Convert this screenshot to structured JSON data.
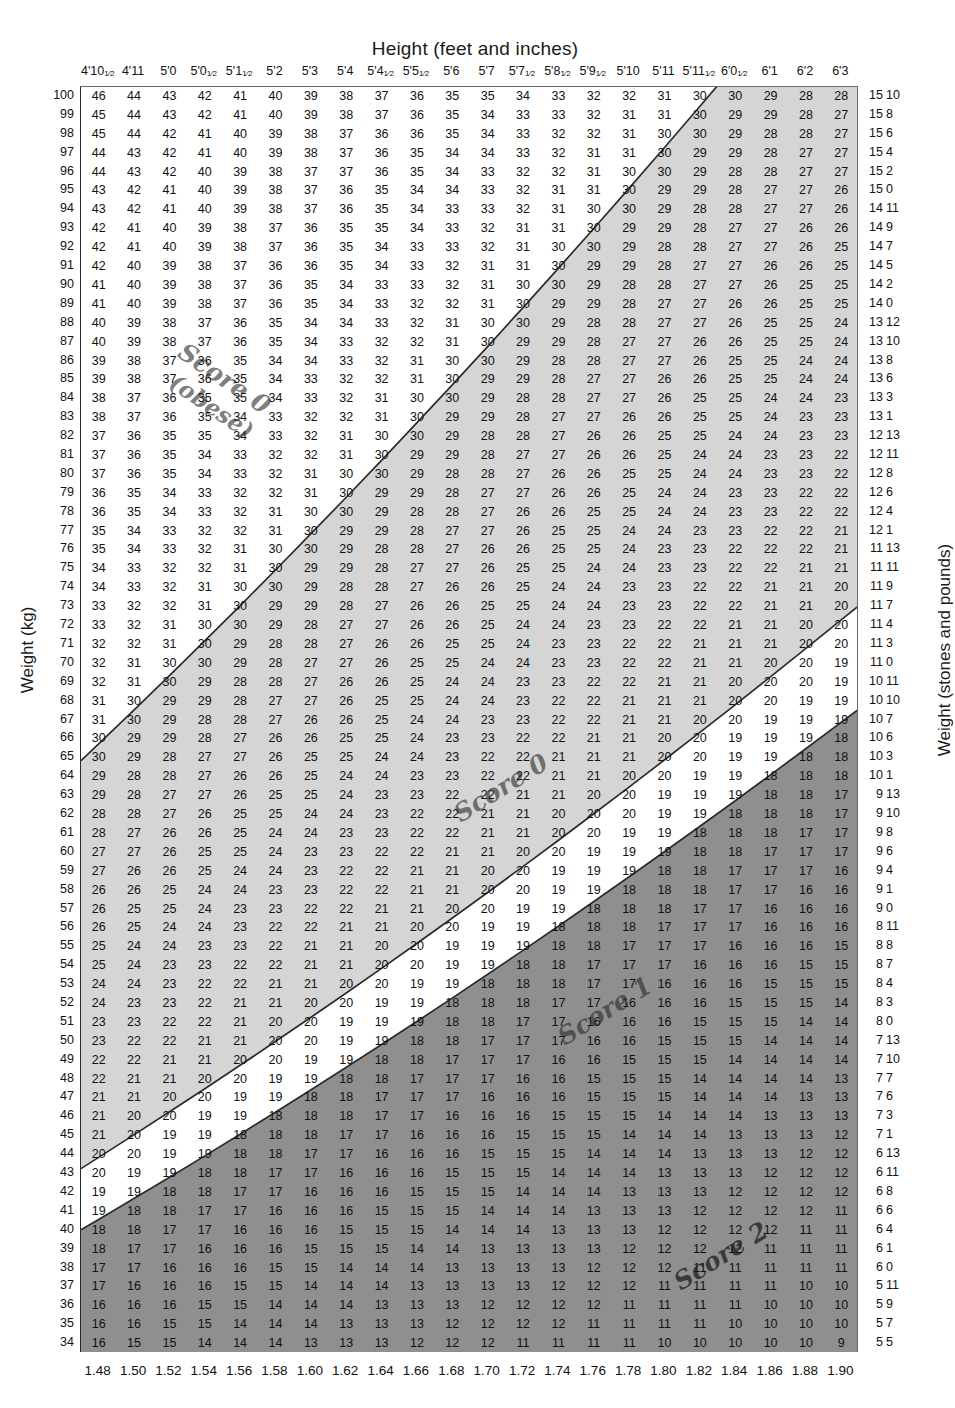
{
  "titles": {
    "top": "Height (feet and inches)",
    "left": "Weight (kg)",
    "right": "Weight (stones and pounds)"
  },
  "annotations": [
    {
      "id": "score0-obese",
      "line1": "Score 0",
      "line2": "(obese)"
    },
    {
      "id": "score0-mid",
      "line1": "Score 0",
      "line2": ""
    },
    {
      "id": "score1-note",
      "line1": "Score 1",
      "line2": ""
    },
    {
      "id": "score2-note",
      "line1": "Score 2",
      "line2": ""
    }
  ],
  "chart_data": {
    "type": "heatmap",
    "xlabel": "Height (feet and inches)",
    "ylabel": "Weight (kg)",
    "x2label": "Height (metres)",
    "y2label": "Weight (stones and pounds)",
    "grid": false,
    "legend_position": "inline-annotations",
    "value_description": "Body Mass Index = weight(kg) / height(m)^2, rounded to nearest whole number",
    "heights_m": [
      1.48,
      1.5,
      1.52,
      1.54,
      1.56,
      1.58,
      1.6,
      1.62,
      1.64,
      1.66,
      1.68,
      1.7,
      1.72,
      1.74,
      1.76,
      1.78,
      1.8,
      1.82,
      1.84,
      1.86,
      1.88,
      1.9
    ],
    "heights_imperial": [
      {
        "ft": "4'10",
        "frac": "1/2"
      },
      {
        "ft": "4'11",
        "frac": ""
      },
      {
        "ft": "5'0",
        "frac": ""
      },
      {
        "ft": "5'0",
        "frac": "1/2"
      },
      {
        "ft": "5'1",
        "frac": "1/2"
      },
      {
        "ft": "5'2",
        "frac": ""
      },
      {
        "ft": "5'3",
        "frac": ""
      },
      {
        "ft": "5'4",
        "frac": ""
      },
      {
        "ft": "5'4",
        "frac": "1/2"
      },
      {
        "ft": "5'5",
        "frac": "1/2"
      },
      {
        "ft": "5'6",
        "frac": ""
      },
      {
        "ft": "5'7",
        "frac": ""
      },
      {
        "ft": "5'7",
        "frac": "1/2"
      },
      {
        "ft": "5'8",
        "frac": "1/2"
      },
      {
        "ft": "5'9",
        "frac": "1/2"
      },
      {
        "ft": "5'10",
        "frac": ""
      },
      {
        "ft": "5'11",
        "frac": ""
      },
      {
        "ft": "5'11",
        "frac": "1/2"
      },
      {
        "ft": "6'0",
        "frac": "1/2"
      },
      {
        "ft": "6'1",
        "frac": ""
      },
      {
        "ft": "6'2",
        "frac": ""
      },
      {
        "ft": "6'3",
        "frac": ""
      }
    ],
    "weights_kg": [
      100,
      99,
      98,
      97,
      96,
      95,
      94,
      93,
      92,
      91,
      90,
      89,
      88,
      87,
      86,
      85,
      84,
      83,
      82,
      81,
      80,
      79,
      78,
      77,
      76,
      75,
      74,
      73,
      72,
      71,
      70,
      69,
      68,
      67,
      66,
      65,
      64,
      63,
      62,
      61,
      60,
      59,
      58,
      57,
      56,
      55,
      54,
      53,
      52,
      51,
      50,
      49,
      48,
      47,
      46,
      45,
      44,
      43,
      42,
      41,
      40,
      39,
      38,
      37,
      36,
      35,
      34
    ],
    "weights_stones_lbs": [
      [
        15,
        10
      ],
      [
        15,
        8
      ],
      [
        15,
        6
      ],
      [
        15,
        4
      ],
      [
        15,
        2
      ],
      [
        15,
        0
      ],
      [
        14,
        11
      ],
      [
        14,
        9
      ],
      [
        14,
        7
      ],
      [
        14,
        5
      ],
      [
        14,
        2
      ],
      [
        14,
        0
      ],
      [
        13,
        12
      ],
      [
        13,
        10
      ],
      [
        13,
        8
      ],
      [
        13,
        6
      ],
      [
        13,
        3
      ],
      [
        13,
        1
      ],
      [
        12,
        13
      ],
      [
        12,
        11
      ],
      [
        12,
        8
      ],
      [
        12,
        6
      ],
      [
        12,
        4
      ],
      [
        12,
        1
      ],
      [
        11,
        13
      ],
      [
        11,
        11
      ],
      [
        11,
        9
      ],
      [
        11,
        7
      ],
      [
        11,
        4
      ],
      [
        11,
        3
      ],
      [
        11,
        0
      ],
      [
        10,
        11
      ],
      [
        10,
        10
      ],
      [
        10,
        7
      ],
      [
        10,
        6
      ],
      [
        10,
        3
      ],
      [
        10,
        1
      ],
      [
        9,
        13
      ],
      [
        9,
        10
      ],
      [
        9,
        8
      ],
      [
        9,
        6
      ],
      [
        9,
        4
      ],
      [
        9,
        1
      ],
      [
        9,
        0
      ],
      [
        8,
        11
      ],
      [
        8,
        8
      ],
      [
        8,
        7
      ],
      [
        8,
        4
      ],
      [
        8,
        3
      ],
      [
        8,
        0
      ],
      [
        7,
        13
      ],
      [
        7,
        10
      ],
      [
        7,
        7
      ],
      [
        7,
        6
      ],
      [
        7,
        3
      ],
      [
        7,
        1
      ],
      [
        6,
        13
      ],
      [
        6,
        11
      ],
      [
        6,
        8
      ],
      [
        6,
        6
      ],
      [
        6,
        4
      ],
      [
        6,
        1
      ],
      [
        6,
        0
      ],
      [
        5,
        11
      ],
      [
        5,
        9
      ],
      [
        5,
        7
      ],
      [
        5,
        5
      ]
    ],
    "bands": [
      {
        "label": "Score 0 (obese)",
        "bmi_min": 30,
        "bmi_max": 999,
        "fill": "#ffffff",
        "note": "white, above BMI 30 line"
      },
      {
        "label": "Score 0",
        "bmi_min": 20,
        "bmi_max": 30,
        "fill": "#d5d5d5",
        "note": "light grey band"
      },
      {
        "label": "Score 1",
        "bmi_min": 18.5,
        "bmi_max": 20,
        "fill": "#ffffff",
        "note": "white band"
      },
      {
        "label": "Score 2",
        "bmi_min": 0,
        "bmi_max": 18.5,
        "fill": "#8f8f8f",
        "note": "dark grey region"
      }
    ],
    "boundary_lines": [
      {
        "bmi": 30,
        "style": "solid",
        "color": "#2b2b2b"
      },
      {
        "bmi": 20,
        "style": "solid",
        "color": "#2b2b2b"
      },
      {
        "bmi": 18.5,
        "style": "solid",
        "color": "#2b2b2b"
      }
    ],
    "colors": {
      "band_light": "#d5d5d5",
      "band_dark": "#8f8f8f",
      "band_white": "#ffffff",
      "line": "#2b2b2b",
      "text": "#111111"
    }
  }
}
